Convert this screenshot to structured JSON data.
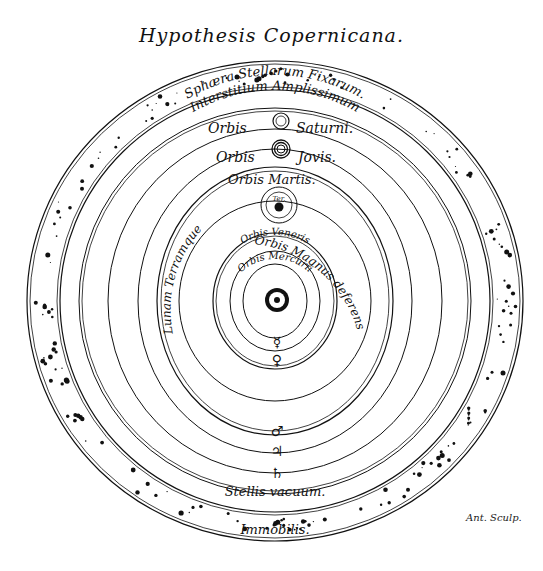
{
  "title": "Hypothesis Copernicana.",
  "signature": "Ant. Sculp.",
  "center": {
    "x": 275,
    "y": 300
  },
  "colors": {
    "ink": "#111111",
    "paper": "#ffffff"
  },
  "labels": {
    "sphaera": "Sphæra Stellarum Fixarum.",
    "interstitium": "Interstitium Amplissimum",
    "saturn": "Orbis Saturni.",
    "jupiter": "Orbis Jovis.",
    "mars": "Orbis Martis.",
    "terra": "Ter.",
    "magnus": "Orbis Magnus deferens",
    "lunam": "Lunam Terramque",
    "venus": "Orbis Veneris",
    "mercury": "Orbis Mercurii",
    "vacuum": "Stellis vacuum.",
    "immobilis": "Immobilis."
  },
  "symbols": {
    "mercury": "☿",
    "venus": "♀",
    "mars": "♂",
    "jupiter": "♃",
    "saturn": "♄"
  }
}
